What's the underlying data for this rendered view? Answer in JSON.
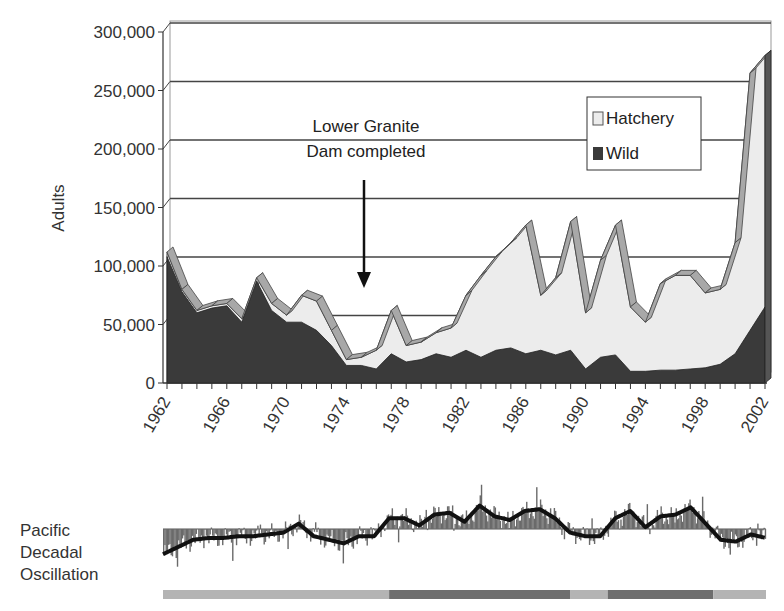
{
  "chart_data": [
    {
      "type": "area",
      "stacked": true,
      "title": "",
      "xlabel": "",
      "ylabel": "Adults",
      "ylim": [
        0,
        300000
      ],
      "yticks": [
        0,
        50000,
        100000,
        150000,
        200000,
        250000,
        300000
      ],
      "ytick_labels": [
        "0",
        "50,000",
        "100,000",
        "150,000",
        "200,000",
        "250,000",
        "300,000"
      ],
      "xtick_labels": [
        "1962",
        "1966",
        "1970",
        "1974",
        "1978",
        "1982",
        "1986",
        "1990",
        "1994",
        "1998",
        "2002"
      ],
      "grid": true,
      "legend_position": "upper right",
      "x": [
        1962,
        1963,
        1964,
        1965,
        1966,
        1967,
        1968,
        1969,
        1970,
        1971,
        1972,
        1973,
        1974,
        1975,
        1976,
        1977,
        1978,
        1979,
        1980,
        1981,
        1982,
        1983,
        1984,
        1985,
        1986,
        1987,
        1988,
        1989,
        1990,
        1991,
        1992,
        1993,
        1994,
        1995,
        1996,
        1997,
        1998,
        1999,
        2000,
        2001,
        2002
      ],
      "series": [
        {
          "name": "Wild",
          "color": "#3a3a3a",
          "values": [
            108000,
            78000,
            60000,
            64000,
            66000,
            52000,
            87000,
            62000,
            52000,
            52000,
            45000,
            32000,
            15000,
            15000,
            12000,
            25000,
            18000,
            20000,
            25000,
            22000,
            28000,
            22000,
            28000,
            30000,
            25000,
            28000,
            24000,
            28000,
            12000,
            22000,
            24000,
            10000,
            10000,
            11000,
            11000,
            12000,
            13000,
            16000,
            25000,
            45000,
            65000
          ]
        },
        {
          "name": "Hatchery",
          "color": "#ececec",
          "values": [
            4000,
            2000,
            2000,
            2000,
            2000,
            3000,
            3000,
            6000,
            6000,
            23000,
            25000,
            13000,
            5000,
            7000,
            16000,
            37000,
            14000,
            15000,
            18000,
            25000,
            47000,
            70000,
            80000,
            90000,
            110000,
            47000,
            66000,
            110000,
            48000,
            83000,
            111000,
            55000,
            42000,
            74000,
            81000,
            80000,
            64000,
            64000,
            95000,
            220000,
            215000
          ]
        }
      ],
      "totals": [
        112000,
        80000,
        62000,
        66000,
        68000,
        55000,
        90000,
        68000,
        58000,
        75000,
        70000,
        45000,
        20000,
        22000,
        28000,
        62000,
        32000,
        35000,
        43000,
        47000,
        75000,
        92000,
        108000,
        120000,
        135000,
        75000,
        90000,
        138000,
        60000,
        105000,
        135000,
        65000,
        52000,
        85000,
        92000,
        92000,
        77000,
        80000,
        120000,
        265000,
        280000
      ],
      "annotations": [
        {
          "text_lines": [
            "Lower Granite",
            "Dam completed"
          ],
          "year": 1975,
          "type": "arrow-down"
        }
      ]
    },
    {
      "type": "bar",
      "title": "Pacific Decadal Oscillation",
      "description": "Monthly PDO index bars with smoothed running-mean line, spanning 1962-2002",
      "baseline": 0,
      "phase_bar": {
        "segments": [
          {
            "phase": "cool",
            "start_year": 1962,
            "end_year": 1977,
            "color": "#b4b4b4"
          },
          {
            "phase": "warm",
            "start_year": 1977,
            "end_year": 1989,
            "color": "#6e6e6e"
          },
          {
            "phase": "cool",
            "start_year": 1989,
            "end_year": 1991.5,
            "color": "#b4b4b4"
          },
          {
            "phase": "warm",
            "start_year": 1991.5,
            "end_year": 1998.5,
            "color": "#6e6e6e"
          },
          {
            "phase": "cool",
            "start_year": 1998.5,
            "end_year": 2002,
            "color": "#b4b4b4"
          }
        ]
      },
      "smoothed_values": [
        -1.4,
        -1.0,
        -0.6,
        -0.5,
        -0.5,
        -0.4,
        -0.4,
        -0.3,
        -0.2,
        0.3,
        -0.4,
        -0.6,
        -0.8,
        -0.4,
        -0.4,
        0.6,
        0.6,
        0.2,
        0.8,
        0.9,
        0.4,
        1.3,
        0.7,
        0.5,
        1.0,
        1.1,
        0.6,
        -0.2,
        -0.4,
        -0.4,
        0.6,
        1.0,
        0.1,
        0.7,
        0.8,
        1.2,
        0.3,
        -0.6,
        -0.7,
        -0.3,
        -0.5
      ]
    }
  ],
  "labels": {
    "ylabel": "Adults",
    "legend": {
      "hatchery": "Hatchery",
      "wild": "Wild"
    },
    "annotation_line1": "Lower Granite",
    "annotation_line2": "Dam completed",
    "pdo_line1": "Pacific",
    "pdo_line2": "Decadal",
    "pdo_line3": "Oscillation"
  },
  "colors": {
    "wild": "#3a3a3a",
    "hatchery": "#ececec",
    "ridge": "#a8a8a8",
    "grid": "#444444",
    "pdo_bar": "#6a6a6a",
    "pdo_line": "#111111",
    "phase_cool": "#b4b4b4",
    "phase_warm": "#6e6e6e"
  }
}
